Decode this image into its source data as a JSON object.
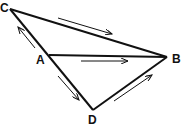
{
  "diagram": {
    "type": "vector-triangle",
    "vertices": {
      "C": {
        "label": "C",
        "x": 10,
        "y": 9
      },
      "A": {
        "label": "A",
        "x": 49,
        "y": 55
      },
      "B": {
        "label": "B",
        "x": 167,
        "y": 57
      },
      "D": {
        "label": "D",
        "x": 93,
        "y": 110
      }
    },
    "edges": [
      {
        "from": "C",
        "to": "B"
      },
      {
        "from": "A",
        "to": "B"
      },
      {
        "from": "C",
        "to": "D"
      },
      {
        "from": "D",
        "to": "B"
      }
    ],
    "arrows": [
      {
        "along": "C-B",
        "direction": "toward B"
      },
      {
        "along": "A-B",
        "direction": "toward B"
      },
      {
        "along": "A-C",
        "direction": "toward C"
      },
      {
        "along": "A-D",
        "direction": "toward D"
      },
      {
        "along": "D-B",
        "direction": "toward B"
      }
    ],
    "colors": {
      "line": "#111111",
      "background": "#ffffff"
    }
  }
}
